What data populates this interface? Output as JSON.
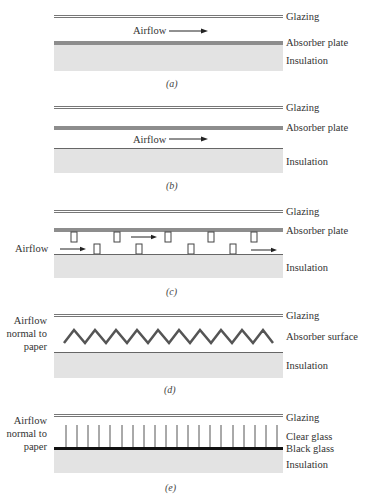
{
  "panels": [
    {
      "id": "a",
      "caption": "(a)",
      "labels": {
        "glazing": "Glazing",
        "absorber": "Absorber plate",
        "insulation": "Insulation",
        "airflow": "Airflow"
      }
    },
    {
      "id": "b",
      "caption": "(b)",
      "labels": {
        "glazing": "Glazing",
        "absorber": "Absorber plate",
        "insulation": "Insulation",
        "airflow": "Airflow"
      }
    },
    {
      "id": "c",
      "caption": "(c)",
      "labels": {
        "glazing": "Glazing",
        "absorber": "Absorber plate",
        "insulation": "Insulation",
        "airflow": "Airflow"
      }
    },
    {
      "id": "d",
      "caption": "(d)",
      "labels": {
        "glazing": "Glazing",
        "absorber": "Absorber surface",
        "insulation": "Insulation",
        "airflow_line1": "Airflow",
        "airflow_line2": "normal to",
        "airflow_line3": "paper"
      },
      "zigzag_peaks": 10
    },
    {
      "id": "e",
      "caption": "(e)",
      "labels": {
        "glazing": "Glazing",
        "clear_glass": "Clear glass",
        "black_glass": "Black glass",
        "insulation": "Insulation",
        "airflow_line1": "Airflow",
        "airflow_line2": "normal to",
        "airflow_line3": "paper"
      },
      "fin_count": 20
    }
  ],
  "colors": {
    "absorber": "#8d8d8d",
    "insulation": "#e3e3e3",
    "line": "#555555",
    "black_glass": "#111111"
  }
}
